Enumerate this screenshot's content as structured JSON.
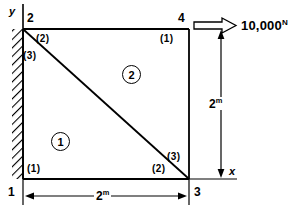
{
  "diagram": {
    "axes": {
      "y_label": "y",
      "x_label": "x"
    },
    "nodes": [
      {
        "id": "node-2",
        "label": "2",
        "position": "top-left"
      },
      {
        "id": "node-4",
        "label": "4",
        "position": "top-right"
      },
      {
        "id": "node-1",
        "label": "1",
        "position": "bottom-left"
      },
      {
        "id": "node-3",
        "label": "3",
        "position": "bottom-right"
      }
    ],
    "elements": [
      {
        "id": "element-1",
        "label": "1",
        "region": "lower-left-triangle"
      },
      {
        "id": "element-2",
        "label": "2",
        "region": "upper-right-triangle"
      }
    ],
    "local_node_labels": [
      {
        "id": "elem2-local-2",
        "label": "(2)"
      },
      {
        "id": "elem1-local-3",
        "label": "(3)"
      },
      {
        "id": "elem2-local-1",
        "label": "(1)"
      },
      {
        "id": "elem2-local-3",
        "label": "(3)"
      },
      {
        "id": "elem1-local-1",
        "label": "(1)"
      },
      {
        "id": "elem1-local-2",
        "label": "(2)"
      }
    ],
    "dimensions": [
      {
        "id": "horizontal-dimension",
        "value": "2",
        "unit": "m"
      },
      {
        "id": "vertical-dimension",
        "value": "2",
        "unit": "m"
      }
    ],
    "load": {
      "magnitude": "10,000",
      "unit": "N",
      "direction": "right"
    },
    "support": {
      "type": "fixed-hatched-edge",
      "edge": "left"
    },
    "colors": {
      "line": "#000000",
      "background": "#ffffff"
    }
  }
}
